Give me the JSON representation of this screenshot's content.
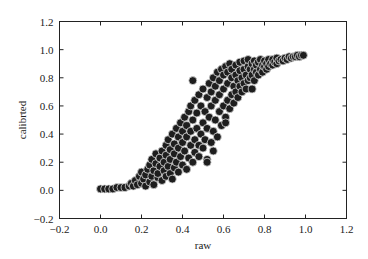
{
  "chart_data": {
    "type": "scatter",
    "title": "",
    "xlabel": "raw",
    "ylabel": "calibrted",
    "xlim": [
      -0.2,
      1.2
    ],
    "ylim": [
      -0.2,
      1.2
    ],
    "xticks": [
      -0.2,
      0.0,
      0.2,
      0.4,
      0.6,
      0.8,
      1.0,
      1.2
    ],
    "yticks": [
      -0.2,
      0.0,
      0.2,
      0.4,
      0.6,
      0.8,
      1.0,
      1.2
    ],
    "xtick_labels": [
      "−0.2",
      "0.0",
      "0.2",
      "0.4",
      "0.6",
      "0.8",
      "1.0",
      "1.2"
    ],
    "ytick_labels": [
      "−0.2",
      "0.0",
      "0.2",
      "0.4",
      "0.6",
      "0.8",
      "1.0",
      "1.2"
    ],
    "grid": false,
    "legend": null,
    "marker": {
      "color": "#1e1e1e",
      "edgecolor": "#d8d8d8",
      "radius": 4
    },
    "points": [
      [
        0.0,
        0.01
      ],
      [
        0.02,
        0.01
      ],
      [
        0.04,
        0.01
      ],
      [
        0.06,
        0.01
      ],
      [
        0.08,
        0.02
      ],
      [
        0.1,
        0.02
      ],
      [
        0.12,
        0.02
      ],
      [
        0.14,
        0.03
      ],
      [
        0.15,
        0.05
      ],
      [
        0.16,
        0.03
      ],
      [
        0.17,
        0.07
      ],
      [
        0.18,
        0.04
      ],
      [
        0.19,
        0.1
      ],
      [
        0.2,
        0.05
      ],
      [
        0.2,
        0.13
      ],
      [
        0.21,
        0.08
      ],
      [
        0.22,
        0.03
      ],
      [
        0.22,
        0.11
      ],
      [
        0.23,
        0.15
      ],
      [
        0.24,
        0.06
      ],
      [
        0.24,
        0.18
      ],
      [
        0.25,
        0.1
      ],
      [
        0.25,
        0.22
      ],
      [
        0.26,
        0.04
      ],
      [
        0.26,
        0.14
      ],
      [
        0.27,
        0.19
      ],
      [
        0.27,
        0.26
      ],
      [
        0.28,
        0.09
      ],
      [
        0.28,
        0.12
      ],
      [
        0.29,
        0.17
      ],
      [
        0.29,
        0.23
      ],
      [
        0.3,
        0.07
      ],
      [
        0.3,
        0.28
      ],
      [
        0.31,
        0.14
      ],
      [
        0.31,
        0.2
      ],
      [
        0.32,
        0.1
      ],
      [
        0.32,
        0.25
      ],
      [
        0.32,
        0.32
      ],
      [
        0.33,
        0.17
      ],
      [
        0.33,
        0.36
      ],
      [
        0.34,
        0.12
      ],
      [
        0.34,
        0.22
      ],
      [
        0.34,
        0.29
      ],
      [
        0.35,
        0.08
      ],
      [
        0.35,
        0.4
      ],
      [
        0.36,
        0.16
      ],
      [
        0.36,
        0.26
      ],
      [
        0.36,
        0.33
      ],
      [
        0.37,
        0.2
      ],
      [
        0.37,
        0.44
      ],
      [
        0.38,
        0.13
      ],
      [
        0.38,
        0.3
      ],
      [
        0.38,
        0.38
      ],
      [
        0.39,
        0.24
      ],
      [
        0.39,
        0.48
      ],
      [
        0.4,
        0.18
      ],
      [
        0.4,
        0.34
      ],
      [
        0.4,
        0.42
      ],
      [
        0.41,
        0.28
      ],
      [
        0.41,
        0.52
      ],
      [
        0.42,
        0.15
      ],
      [
        0.42,
        0.38
      ],
      [
        0.42,
        0.46
      ],
      [
        0.43,
        0.23
      ],
      [
        0.43,
        0.56
      ],
      [
        0.44,
        0.32
      ],
      [
        0.44,
        0.42
      ],
      [
        0.44,
        0.6
      ],
      [
        0.45,
        0.2
      ],
      [
        0.45,
        0.5
      ],
      [
        0.46,
        0.27
      ],
      [
        0.46,
        0.36
      ],
      [
        0.46,
        0.64
      ],
      [
        0.47,
        0.44
      ],
      [
        0.47,
        0.55
      ],
      [
        0.48,
        0.24
      ],
      [
        0.48,
        0.32
      ],
      [
        0.48,
        0.68
      ],
      [
        0.49,
        0.4
      ],
      [
        0.49,
        0.6
      ],
      [
        0.5,
        0.3
      ],
      [
        0.5,
        0.48
      ],
      [
        0.5,
        0.72
      ],
      [
        0.51,
        0.36
      ],
      [
        0.51,
        0.56
      ],
      [
        0.52,
        0.22
      ],
      [
        0.52,
        0.44
      ],
      [
        0.52,
        0.66
      ],
      [
        0.53,
        0.52
      ],
      [
        0.53,
        0.76
      ],
      [
        0.54,
        0.34
      ],
      [
        0.54,
        0.6
      ],
      [
        0.54,
        0.7
      ],
      [
        0.55,
        0.42
      ],
      [
        0.55,
        0.8
      ],
      [
        0.56,
        0.5
      ],
      [
        0.56,
        0.64
      ],
      [
        0.56,
        0.74
      ],
      [
        0.57,
        0.38
      ],
      [
        0.57,
        0.84
      ],
      [
        0.58,
        0.56
      ],
      [
        0.58,
        0.68
      ],
      [
        0.58,
        0.78
      ],
      [
        0.59,
        0.46
      ],
      [
        0.59,
        0.86
      ],
      [
        0.6,
        0.6
      ],
      [
        0.6,
        0.72
      ],
      [
        0.6,
        0.82
      ],
      [
        0.61,
        0.52
      ],
      [
        0.61,
        0.88
      ],
      [
        0.62,
        0.64
      ],
      [
        0.62,
        0.76
      ],
      [
        0.62,
        0.84
      ],
      [
        0.63,
        0.58
      ],
      [
        0.63,
        0.9
      ],
      [
        0.64,
        0.68
      ],
      [
        0.64,
        0.8
      ],
      [
        0.64,
        0.86
      ],
      [
        0.65,
        0.62
      ],
      [
        0.65,
        0.74
      ],
      [
        0.66,
        0.7
      ],
      [
        0.66,
        0.82
      ],
      [
        0.66,
        0.89
      ],
      [
        0.67,
        0.66
      ],
      [
        0.67,
        0.78
      ],
      [
        0.68,
        0.74
      ],
      [
        0.68,
        0.85
      ],
      [
        0.68,
        0.91
      ],
      [
        0.69,
        0.7
      ],
      [
        0.69,
        0.8
      ],
      [
        0.7,
        0.76
      ],
      [
        0.7,
        0.86
      ],
      [
        0.7,
        0.92
      ],
      [
        0.71,
        0.72
      ],
      [
        0.71,
        0.82
      ],
      [
        0.72,
        0.78
      ],
      [
        0.72,
        0.88
      ],
      [
        0.72,
        0.93
      ],
      [
        0.73,
        0.8
      ],
      [
        0.73,
        0.86
      ],
      [
        0.74,
        0.82
      ],
      [
        0.74,
        0.9
      ],
      [
        0.75,
        0.78
      ],
      [
        0.75,
        0.86
      ],
      [
        0.75,
        0.92
      ],
      [
        0.76,
        0.84
      ],
      [
        0.76,
        0.89
      ],
      [
        0.77,
        0.82
      ],
      [
        0.77,
        0.91
      ],
      [
        0.78,
        0.86
      ],
      [
        0.78,
        0.93
      ],
      [
        0.79,
        0.84
      ],
      [
        0.79,
        0.89
      ],
      [
        0.8,
        0.88
      ],
      [
        0.8,
        0.92
      ],
      [
        0.81,
        0.86
      ],
      [
        0.81,
        0.9
      ],
      [
        0.82,
        0.88
      ],
      [
        0.82,
        0.93
      ],
      [
        0.83,
        0.9
      ],
      [
        0.84,
        0.89
      ],
      [
        0.84,
        0.93
      ],
      [
        0.85,
        0.91
      ],
      [
        0.86,
        0.9
      ],
      [
        0.86,
        0.94
      ],
      [
        0.87,
        0.92
      ],
      [
        0.88,
        0.93
      ],
      [
        0.89,
        0.92
      ],
      [
        0.9,
        0.94
      ],
      [
        0.91,
        0.93
      ],
      [
        0.92,
        0.95
      ],
      [
        0.93,
        0.94
      ],
      [
        0.94,
        0.95
      ],
      [
        0.95,
        0.95
      ],
      [
        0.96,
        0.96
      ],
      [
        0.97,
        0.95
      ],
      [
        0.98,
        0.96
      ],
      [
        0.99,
        0.96
      ],
      [
        0.45,
        0.78
      ],
      [
        0.61,
        0.48
      ],
      [
        0.55,
        0.28
      ],
      [
        0.52,
        0.2
      ],
      [
        0.74,
        0.72
      ]
    ]
  }
}
